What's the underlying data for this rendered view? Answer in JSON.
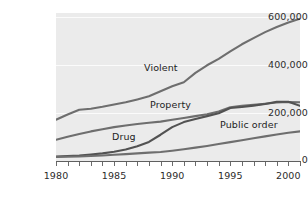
{
  "chart_data": {
    "type": "line",
    "title": "",
    "xlabel": "",
    "ylabel": "",
    "xlim": [
      1980,
      2001
    ],
    "ylim": [
      0,
      620000
    ],
    "grid": true,
    "legend_position": "inline-labels",
    "y_ticks": [
      {
        "value": 0,
        "label": "0"
      },
      {
        "value": 200000,
        "label": "200,000"
      },
      {
        "value": 400000,
        "label": "400,000"
      },
      {
        "value": 600000,
        "label": "600,000"
      }
    ],
    "x_ticks": [
      1980,
      1981,
      1982,
      1983,
      1984,
      1985,
      1986,
      1987,
      1988,
      1989,
      1990,
      1991,
      1992,
      1993,
      1994,
      1995,
      1996,
      1997,
      1998,
      1999,
      2000,
      2001
    ],
    "x_tick_labels": [
      {
        "value": 1980,
        "label": "1980"
      },
      {
        "value": 1985,
        "label": "1985"
      },
      {
        "value": 1990,
        "label": "1990"
      },
      {
        "value": 1995,
        "label": "1995"
      },
      {
        "value": 2000,
        "label": "2000"
      }
    ],
    "x": [
      1980,
      1981,
      1982,
      1983,
      1984,
      1985,
      1986,
      1987,
      1988,
      1989,
      1990,
      1991,
      1992,
      1993,
      1994,
      1995,
      1996,
      1997,
      1998,
      1999,
      2000,
      2001
    ],
    "series": [
      {
        "name": "Violent",
        "label": "Violent",
        "color": "#6e6e6e",
        "values": [
          173000,
          195000,
          215000,
          219000,
          227000,
          237000,
          246000,
          258000,
          271000,
          292000,
          313000,
          330000,
          369000,
          401000,
          428000,
          459000,
          489000,
          515000,
          540000,
          561000,
          580000,
          596000
        ]
      },
      {
        "name": "Property",
        "label": "Property",
        "color": "#6e6e6e",
        "values": [
          89000,
          102000,
          113000,
          124000,
          133000,
          142000,
          149000,
          155000,
          160000,
          165000,
          173000,
          180000,
          188000,
          196000,
          207000,
          225000,
          231000,
          235000,
          240000,
          245000,
          247000,
          246000
        ]
      },
      {
        "name": "Drug",
        "label": "Drug",
        "color": "#525252",
        "values": [
          19000,
          21000,
          23000,
          27000,
          32000,
          39000,
          48000,
          62000,
          80000,
          110000,
          142000,
          163000,
          176000,
          188000,
          200000,
          222000,
          226000,
          232000,
          239000,
          248000,
          248000,
          231000
        ]
      },
      {
        "name": "Public order",
        "label": "Public order",
        "color": "#6e6e6e",
        "values": [
          17000,
          18000,
          19000,
          21000,
          23000,
          26000,
          29000,
          32000,
          35000,
          38000,
          43000,
          49000,
          56000,
          63000,
          71000,
          79000,
          87000,
          95000,
          103000,
          111000,
          118000,
          124000
        ]
      }
    ],
    "annotations": [
      {
        "name": "violent-label",
        "text": "Violent",
        "x_px": 144,
        "y_px": 62
      },
      {
        "name": "property-label",
        "text": "Property",
        "x_px": 150,
        "y_px": 99
      },
      {
        "name": "drug-label",
        "text": "Drug",
        "x_px": 112,
        "y_px": 131
      },
      {
        "name": "public-order-label",
        "text": "Public order",
        "x_px": 220,
        "y_px": 119
      }
    ],
    "colors": {
      "panel_background": "#ebebeb",
      "gridline": "#fbfbfb",
      "axis": "#5f5f5f",
      "text": "#2b2b2b",
      "line_default": "#6e6e6e",
      "line_drug": "#525252"
    }
  }
}
